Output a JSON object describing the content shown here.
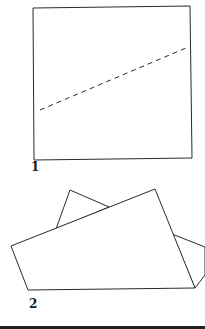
{
  "steps": [
    {
      "number": "1",
      "description": "square sheet with dashed fold line"
    },
    {
      "number": "2",
      "description": "sheet folded along the diagonal line"
    }
  ],
  "colors": {
    "line": "#2a2a2a",
    "background": "#ffffff"
  }
}
